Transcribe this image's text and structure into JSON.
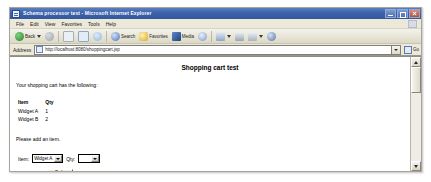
{
  "window": {
    "title": "Schema processor test - Microsoft Internet Explorer",
    "icon": "ie-document-icon",
    "controls": {
      "minimize": "Minimize",
      "maximize": "Maximize",
      "close": "Close"
    }
  },
  "menu": {
    "items": [
      {
        "label": "File"
      },
      {
        "label": "Edit"
      },
      {
        "label": "View"
      },
      {
        "label": "Favorites"
      },
      {
        "label": "Tools"
      },
      {
        "label": "Help"
      }
    ],
    "brand_icon": "ie-logo-icon"
  },
  "toolbar": {
    "buttons": [
      {
        "label": "Back",
        "icon": "back-arrow-icon",
        "color": "#3f9a3f"
      },
      {
        "label": "",
        "icon": "forward-arrow-icon",
        "color": "#9aa0a8"
      },
      {
        "label": "",
        "icon": "stop-icon",
        "color": "#c8cdd4"
      },
      {
        "label": "",
        "icon": "refresh-icon",
        "color": "#7fa7d8"
      },
      {
        "label": "",
        "icon": "home-icon",
        "color": "#93b7dd"
      },
      {
        "label": "Search",
        "icon": "search-icon",
        "color": "#5f7fc0"
      },
      {
        "label": "Favorites",
        "icon": "star-icon",
        "color": "#e8c84a"
      },
      {
        "label": "Media",
        "icon": "media-icon",
        "color": "#3c6bb5"
      },
      {
        "label": "",
        "icon": "history-icon",
        "color": "#6b8fc6"
      },
      {
        "label": "",
        "icon": "mail-icon",
        "color": "#8fa6c9"
      },
      {
        "label": "",
        "icon": "print-icon",
        "color": "#9aa5b3"
      },
      {
        "label": "",
        "icon": "edit-icon",
        "color": "#a8b2bf"
      },
      {
        "label": "",
        "icon": "discuss-icon",
        "color": "#6f8fb8"
      }
    ]
  },
  "address": {
    "label": "Address",
    "url": "http://localhost:8080/shoppingcart.jsp",
    "favicon": "page-icon",
    "dropdown_icon": "chevron-down-icon",
    "go_label": "Go",
    "go_icon": "go-arrow-icon"
  },
  "page": {
    "title": "Shopping cart test",
    "intro": "Your shopping cart has the following:",
    "cart": {
      "columns": [
        "Item",
        "Qty"
      ],
      "rows": [
        {
          "item": "Widget A",
          "qty": "1"
        },
        {
          "item": "Widget B",
          "qty": "2"
        }
      ]
    },
    "add_prompt": "Please add an item.",
    "form": {
      "item_label": "Item:",
      "item_value": "Widget A",
      "qty_label": "Qty:",
      "qty_value": "",
      "submit_label": "Order"
    }
  },
  "scrollbar": {
    "up_icon": "scroll-up-icon",
    "down_icon": "scroll-down-icon",
    "thumb": "scroll-thumb"
  }
}
